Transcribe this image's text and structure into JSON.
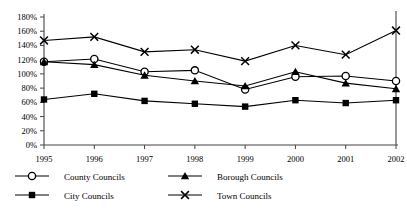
{
  "chart_data": {
    "type": "line",
    "title": "",
    "subtitle": "",
    "xlabel": "",
    "ylabel": "",
    "categories": [
      "1995",
      "1996",
      "1997",
      "1998",
      "1999",
      "2000",
      "2001",
      "2002"
    ],
    "x": [
      1995,
      1996,
      1997,
      1998,
      1999,
      2000,
      2001,
      2002
    ],
    "ylim": [
      0,
      180
    ],
    "xlim": [
      1995,
      2002
    ],
    "y_ticks": [
      0,
      20,
      40,
      60,
      80,
      100,
      120,
      140,
      160,
      180
    ],
    "y_tick_labels": [
      "0%",
      "20%",
      "40%",
      "60%",
      "80%",
      "100%",
      "120%",
      "140%",
      "160%",
      "180%"
    ],
    "grid": false,
    "legend_position": "bottom",
    "series": [
      {
        "name": "County Councils",
        "marker": "open-circle",
        "values": [
          117,
          121,
          103,
          105,
          78,
          96,
          97,
          90
        ]
      },
      {
        "name": "Borough Councils",
        "marker": "filled-triangle",
        "values": [
          117,
          113,
          98,
          90,
          83,
          103,
          87,
          79
        ]
      },
      {
        "name": "City Councils",
        "marker": "filled-square",
        "values": [
          64,
          72,
          62,
          58,
          54,
          63,
          59,
          63
        ]
      },
      {
        "name": "Town Councils",
        "marker": "cross-x",
        "values": [
          147,
          152,
          131,
          134,
          118,
          140,
          127,
          161
        ]
      }
    ],
    "colors": {
      "line": "#000000",
      "axis": "#444444",
      "background": "#ffffff"
    }
  },
  "legend": {
    "items": [
      {
        "label": "County Councils",
        "marker": "open-circle"
      },
      {
        "label": "Borough Councils",
        "marker": "filled-triangle"
      },
      {
        "label": "City Councils",
        "marker": "filled-square"
      },
      {
        "label": "Town Councils",
        "marker": "cross-x"
      }
    ]
  }
}
